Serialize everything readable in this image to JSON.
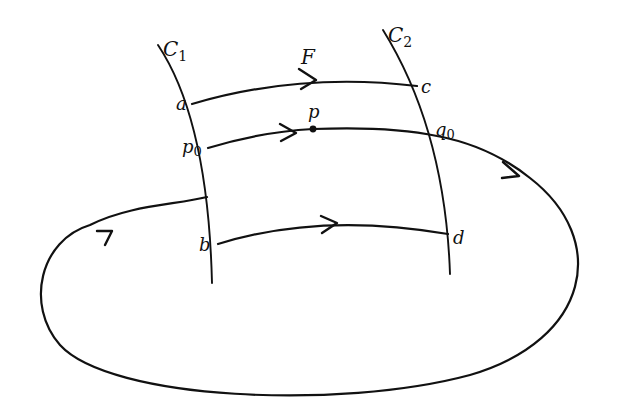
{
  "diagram": {
    "type": "flow-box / Poincaré return map illustration",
    "labels": {
      "section_1": "C",
      "section_1_sub": "1",
      "section_2": "C",
      "section_2_sub": "2",
      "flow": "F",
      "point_a": "a",
      "point_b": "b",
      "point_c": "c",
      "point_d": "d",
      "point_p": "p",
      "point_p0": "p",
      "point_p0_sub": "0",
      "point_q0": "q",
      "point_q0_sub": "0"
    },
    "elements": [
      {
        "id": "C1",
        "kind": "transversal section"
      },
      {
        "id": "C2",
        "kind": "transversal section"
      },
      {
        "id": "a-c",
        "kind": "flow line",
        "direction": "a to c"
      },
      {
        "id": "p0-q0",
        "kind": "orbit",
        "direction": "p0 through p to q0, returns to C1"
      },
      {
        "id": "b-d",
        "kind": "flow line",
        "direction": "b to d"
      }
    ],
    "colors": {
      "ink": "#111111",
      "background": "#ffffff"
    }
  }
}
